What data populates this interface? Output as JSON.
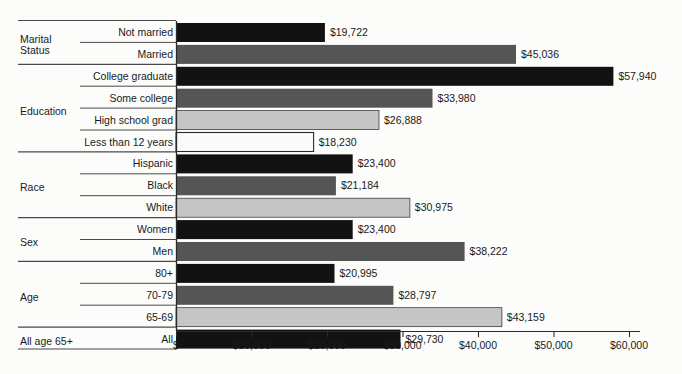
{
  "chart_data": {
    "type": "bar",
    "orientation": "horizontal",
    "title": "",
    "xlabel": "",
    "ylabel": "",
    "xlim": [
      0,
      62000
    ],
    "grid": false,
    "legend": "none",
    "tick_labels": [
      "$",
      "$10,000",
      "$20,000",
      "$30,000",
      "$40,000",
      "$50,000",
      "$60,000"
    ],
    "tick_values": [
      0,
      10000,
      20000,
      30000,
      40000,
      50000,
      60000
    ],
    "groups": [
      {
        "name": "Marital Status",
        "categories": [
          "Not married",
          "Married"
        ],
        "values": [
          19722,
          45036
        ],
        "value_labels": [
          "$19,722",
          "$45,036"
        ],
        "fills": [
          "black",
          "dark",
          ""
        ]
      },
      {
        "name": "Education",
        "categories": [
          "College graduate",
          "Some college",
          "High school grad",
          "Less than 12 years"
        ],
        "values": [
          57940,
          33980,
          26888,
          18230
        ],
        "value_labels": [
          "$57,940",
          "$33,980",
          "$26,888",
          "$18,230"
        ],
        "fills": [
          "black",
          "dark",
          "light",
          "white"
        ]
      },
      {
        "name": "Race",
        "categories": [
          "Hispanic",
          "Black",
          "White"
        ],
        "values": [
          23400,
          21184,
          30975
        ],
        "value_labels": [
          "$23,400",
          "$21,184",
          "$30,975"
        ],
        "fills": [
          "black",
          "dark",
          "light"
        ]
      },
      {
        "name": "Sex",
        "categories": [
          "Women",
          "Men"
        ],
        "values": [
          23400,
          38222
        ],
        "value_labels": [
          "$23,400",
          "$38,222"
        ],
        "fills": [
          "black",
          "dark"
        ]
      },
      {
        "name": "Age",
        "categories": [
          "80+",
          "70-79",
          "65-69"
        ],
        "values": [
          20995,
          28797,
          43159
        ],
        "value_labels": [
          "$20,995",
          "$28,797",
          "$43,159"
        ],
        "fills": [
          "black",
          "dark",
          "light"
        ]
      },
      {
        "name": "All age 65+",
        "categories": [
          "All"
        ],
        "values": [
          29730
        ],
        "value_labels": [
          "$29,730"
        ],
        "fills": [
          "black"
        ]
      }
    ],
    "bars": [
      {
        "group": "Marital Status",
        "category": "Not married",
        "value": 19722,
        "value_label": "$19,722",
        "fill": "black"
      },
      {
        "group": "Marital Status",
        "category": "Married",
        "value": 45036,
        "value_label": "$45,036",
        "fill": "dark"
      },
      {
        "group": "Education",
        "category": "College graduate",
        "value": 57940,
        "value_label": "$57,940",
        "fill": "black"
      },
      {
        "group": "Education",
        "category": "Some college",
        "value": 33980,
        "value_label": "$33,980",
        "fill": "dark"
      },
      {
        "group": "Education",
        "category": "High school grad",
        "value": 26888,
        "value_label": "$26,888",
        "fill": "light"
      },
      {
        "group": "Education",
        "category": "Less than 12 years",
        "value": 18230,
        "value_label": "$18,230",
        "fill": "white"
      },
      {
        "group": "Race",
        "category": "Hispanic",
        "value": 23400,
        "value_label": "$23,400",
        "fill": "black"
      },
      {
        "group": "Race",
        "category": "Black",
        "value": 21184,
        "value_label": "$21,184",
        "fill": "dark"
      },
      {
        "group": "Race",
        "category": "White",
        "value": 30975,
        "value_label": "$30,975",
        "fill": "light"
      },
      {
        "group": "Sex",
        "category": "Women",
        "value": 23400,
        "value_label": "$23,400",
        "fill": "black"
      },
      {
        "group": "Sex",
        "category": "Men",
        "value": 38222,
        "value_label": "$38,222",
        "fill": "dark"
      },
      {
        "group": "Age",
        "category": "80+",
        "value": 20995,
        "value_label": "$20,995",
        "fill": "black"
      },
      {
        "group": "Age",
        "category": "70-79",
        "value": 28797,
        "value_label": "$28,797",
        "fill": "dark"
      },
      {
        "group": "Age",
        "category": "65-69",
        "value": 43159,
        "value_label": "$43,159",
        "fill": "light"
      },
      {
        "group": "All age 65+",
        "category": "All",
        "value": 29730,
        "value_label": "$29,730",
        "fill": "black"
      }
    ]
  },
  "colors": {
    "black": "#121212",
    "dark": "#555555",
    "light": "#c6c6c6",
    "white": "#fbfbfb",
    "outline": "#2a2a2a",
    "rule": "#4a4a4a",
    "axis": "#2a2a2a",
    "background": "#fdfdfc",
    "text": "#1a1a1a"
  },
  "geometry": {
    "axis_x": 176,
    "axis_right": 640,
    "px_per_10k": 75.5,
    "first_bar_top": 23,
    "row_pitch": 21.9,
    "bar_height": 19,
    "axis_y": 331,
    "group_rule_left": 18,
    "row_rule_left": 80,
    "label_right": 173
  }
}
